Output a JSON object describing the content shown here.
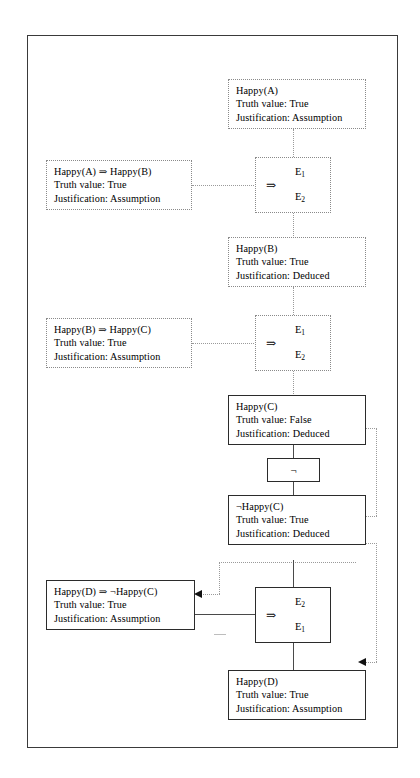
{
  "diagram": {
    "symbols": {
      "implies": "⇒",
      "not": "¬",
      "antecedent": "E",
      "antecedent_sub_1": "1",
      "antecedent_sub_2": "2"
    },
    "labels": {
      "truth_value_prefix": "Truth value:",
      "justification_prefix": "Justification:"
    },
    "nodes": [
      {
        "id": "happy-a",
        "line1": "Happy(A)",
        "line2": "Truth value: True",
        "line3": "Justification: Assumption",
        "border": "dotted"
      },
      {
        "id": "happy-a-implies-happy-b",
        "line1": "Happy(A) ⇒ Happy(B)",
        "line2": "Truth value: True",
        "line3": "Justification: Assumption",
        "border": "dotted"
      },
      {
        "id": "happy-b",
        "line1": "Happy(B)",
        "line2": "Truth value: True",
        "line3": "Justification: Deduced",
        "border": "dotted"
      },
      {
        "id": "happy-b-implies-happy-c",
        "line1": "Happy(B) ⇒ Happy(C)",
        "line2": "Truth value: True",
        "line3": "Justification: Assumption",
        "border": "dotted"
      },
      {
        "id": "happy-c",
        "line1": "Happy(C)",
        "line2": "Truth value: False",
        "line3": "Justification: Deduced",
        "border": "solid"
      },
      {
        "id": "not-happy-c",
        "line1": "¬Happy(C)",
        "line2": "Truth value: True",
        "line3": "Justification: Deduced",
        "border": "solid"
      },
      {
        "id": "happy-d-implies-not-happy-c",
        "line1": "Happy(D) ⇒ ¬Happy(C)",
        "line2": "Truth value: True",
        "line3": "Justification: Assumption",
        "border": "solid"
      },
      {
        "id": "happy-d",
        "line1": "Happy(D)",
        "line2": "Truth value: True",
        "line3": "Justification: Assumption",
        "border": "solid"
      }
    ],
    "rule_boxes": [
      {
        "id": "modus-ponens-1",
        "top": "E",
        "top_sub": "1",
        "bottom": "E",
        "bottom_sub": "2",
        "operator": "⇒",
        "border": "dotted"
      },
      {
        "id": "modus-ponens-2",
        "top": "E",
        "top_sub": "1",
        "bottom": "E",
        "bottom_sub": "2",
        "operator": "⇒",
        "border": "dotted"
      },
      {
        "id": "modus-tollens",
        "top": "E",
        "top_sub": "2",
        "bottom": "E",
        "bottom_sub": "1",
        "operator": "⇒",
        "border": "solid"
      }
    ],
    "negation_box": {
      "id": "negation-operator",
      "symbol": "¬"
    }
  }
}
